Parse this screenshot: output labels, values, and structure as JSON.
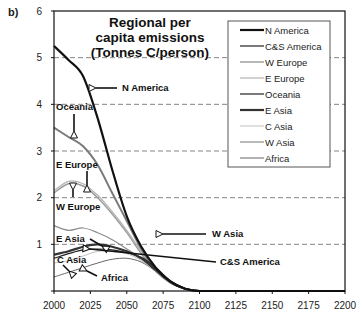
{
  "panel_label": "b)",
  "chart_data": {
    "type": "line",
    "title_lines": [
      "Regional per",
      "capita emissions",
      "(Tonnes C/person)"
    ],
    "xlabel": "",
    "ylabel": "",
    "xlim": [
      2000,
      2200
    ],
    "ylim": [
      0,
      6
    ],
    "xticks": [
      2000,
      2025,
      2050,
      2075,
      2100,
      2125,
      2150,
      2175,
      2200
    ],
    "yticks": [
      1,
      2,
      3,
      4,
      5,
      6
    ],
    "grid": "horizontal dashed at 1,2,3,4,5",
    "legend_position": "upper right",
    "x": [
      2000,
      2010,
      2020,
      2030,
      2040,
      2050,
      2060,
      2070,
      2080,
      2090,
      2100,
      2125,
      2150,
      2175,
      2200
    ],
    "series": [
      {
        "name": "N America",
        "color": "#111111",
        "width": 2.2,
        "values": [
          5.25,
          4.95,
          4.6,
          3.7,
          2.6,
          1.6,
          0.95,
          0.5,
          0.2,
          0.05,
          0,
          0,
          0,
          0,
          0
        ]
      },
      {
        "name": "C&S America",
        "color": "#222222",
        "width": 1.2,
        "values": [
          0.7,
          0.8,
          0.88,
          0.9,
          0.88,
          0.82,
          0.72,
          0.5,
          0.22,
          0.06,
          0,
          0,
          0,
          0,
          0
        ]
      },
      {
        "name": "W Europe",
        "color": "#9a9a9a",
        "width": 1.4,
        "values": [
          2.1,
          2.3,
          2.25,
          2.0,
          1.65,
          1.25,
          0.8,
          0.42,
          0.18,
          0.05,
          0,
          0,
          0,
          0,
          0
        ]
      },
      {
        "name": "E Europe",
        "color": "#b4b4b4",
        "width": 1.2,
        "values": [
          2.15,
          2.35,
          2.3,
          2.05,
          1.7,
          1.3,
          0.85,
          0.45,
          0.19,
          0.05,
          0,
          0,
          0,
          0,
          0
        ]
      },
      {
        "name": "Oceania",
        "color": "#7a7a7a",
        "width": 2.0,
        "values": [
          3.5,
          3.3,
          3.1,
          2.7,
          2.1,
          1.5,
          0.9,
          0.45,
          0.18,
          0.05,
          0,
          0,
          0,
          0,
          0
        ]
      },
      {
        "name": "E Asia",
        "color": "#333333",
        "width": 2.2,
        "values": [
          0.78,
          0.85,
          0.95,
          1.0,
          0.95,
          0.85,
          0.7,
          0.45,
          0.2,
          0.05,
          0,
          0,
          0,
          0,
          0
        ]
      },
      {
        "name": "C Asia",
        "color": "#c0c0c0",
        "width": 1.0,
        "values": [
          0.6,
          0.65,
          0.75,
          0.85,
          0.85,
          0.8,
          0.65,
          0.42,
          0.18,
          0.05,
          0,
          0,
          0,
          0,
          0
        ]
      },
      {
        "name": "W Asia",
        "color": "#8c8c8c",
        "width": 1.2,
        "values": [
          1.4,
          1.3,
          1.35,
          1.25,
          1.1,
          0.9,
          0.7,
          0.45,
          0.2,
          0.05,
          0,
          0,
          0,
          0,
          0
        ]
      },
      {
        "name": "Africa",
        "color": "#666666",
        "width": 1.0,
        "values": [
          0.3,
          0.4,
          0.5,
          0.6,
          0.68,
          0.7,
          0.62,
          0.42,
          0.18,
          0.05,
          0,
          0,
          0,
          0,
          0
        ]
      }
    ],
    "annotations": [
      {
        "text": "N America",
        "x": 2050,
        "y": 4.35,
        "arrow_to": [
          2027,
          4.35
        ],
        "arrow_dir": "left"
      },
      {
        "text": "Oceania",
        "x": 2000,
        "y": 3.8,
        "arrow_to": [
          2015,
          3.3
        ],
        "arrow_dir": "down"
      },
      {
        "text": "E Europe",
        "x": 2000,
        "y": 2.75,
        "arrow_to": [
          2018,
          2.32
        ],
        "arrow_dir": "down"
      },
      {
        "text": "W Europe",
        "x": 2000,
        "y": 1.9,
        "arrow_to": [
          2013,
          2.25
        ],
        "arrow_dir": "up"
      },
      {
        "text": "W Asia",
        "x": 2083,
        "y": 1.25,
        "arrow_to": [
          2045,
          1.25
        ],
        "arrow_dir": "left"
      },
      {
        "text": "E Asia",
        "x": 2000,
        "y": 1.15,
        "arrow_to": [
          2027,
          1.0
        ],
        "arrow_dir": "right"
      },
      {
        "text": "C&S America",
        "x": 2087,
        "y": 0.65,
        "arrow_to": [
          2022,
          0.88
        ],
        "arrow_dir": "left"
      },
      {
        "text": "C Asia",
        "x": 2000,
        "y": 0.65,
        "arrow_to": [
          2012,
          0.52
        ],
        "arrow_dir": "down"
      },
      {
        "text": "Africa",
        "x": 2030,
        "y": 0.3,
        "arrow_to": [
          2018,
          0.48
        ],
        "arrow_dir": "upleft"
      }
    ]
  }
}
